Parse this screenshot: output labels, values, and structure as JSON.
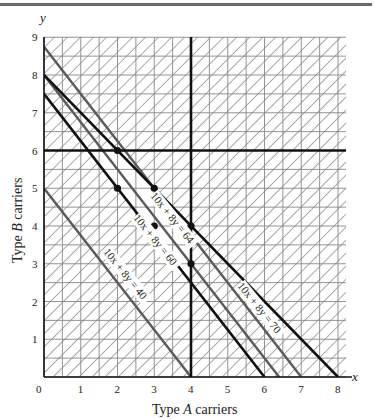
{
  "chart_data": {
    "type": "line",
    "title": "",
    "xlabel": "Type A carriers",
    "ylabel": "Type B carriers",
    "xaxis_letter": "x",
    "yaxis_letter": "y",
    "xlim": [
      0,
      8.2
    ],
    "ylim": [
      0,
      9
    ],
    "xticks": [
      "0",
      "1",
      "2",
      "3",
      "4",
      "5",
      "6",
      "7",
      "8"
    ],
    "yticks": [
      "1",
      "2",
      "3",
      "4",
      "5",
      "6",
      "7",
      "8",
      "9"
    ],
    "grid": "half-unit gridlines with diagonal hatching outside feasible region",
    "series": [
      {
        "name": "10x + 8y = 40",
        "points": [
          [
            0,
            5
          ],
          [
            4,
            0
          ]
        ],
        "color": "#555555"
      },
      {
        "name": "10x + 8y = 60",
        "points": [
          [
            0,
            7.5
          ],
          [
            6,
            0
          ]
        ],
        "color": "#111111"
      },
      {
        "name": "10x + 8y = 64",
        "points": [
          [
            0,
            8
          ],
          [
            6.4,
            0
          ]
        ],
        "color": "#555555"
      },
      {
        "name": "10x + 8y = 70",
        "points": [
          [
            0,
            8.75
          ],
          [
            7,
            0
          ]
        ],
        "color": "#555555"
      },
      {
        "name": "x + y = 8",
        "points": [
          [
            0,
            8
          ],
          [
            8,
            0
          ]
        ],
        "color": "#111111"
      },
      {
        "name": "y = 6",
        "points": [
          [
            0,
            6
          ],
          [
            8.2,
            6
          ]
        ],
        "color": "#111111"
      },
      {
        "name": "x = 4",
        "points": [
          [
            4,
            0
          ],
          [
            4,
            9
          ]
        ],
        "color": "#111111"
      }
    ],
    "feasible_region": [
      [
        1.2,
        6
      ],
      [
        2,
        6
      ],
      [
        4,
        4
      ],
      [
        4,
        2.5
      ]
    ],
    "marked_points": [
      [
        2,
        6
      ],
      [
        3,
        5
      ],
      [
        2,
        5
      ],
      [
        3,
        4
      ],
      [
        4,
        4
      ],
      [
        4,
        3
      ]
    ],
    "annotations": [
      {
        "text": "10x + 8y = 40"
      },
      {
        "text": "10x + 8y = 60"
      },
      {
        "text": "10x + 8y = 64"
      },
      {
        "text": "10x + 8y = 70"
      }
    ]
  }
}
